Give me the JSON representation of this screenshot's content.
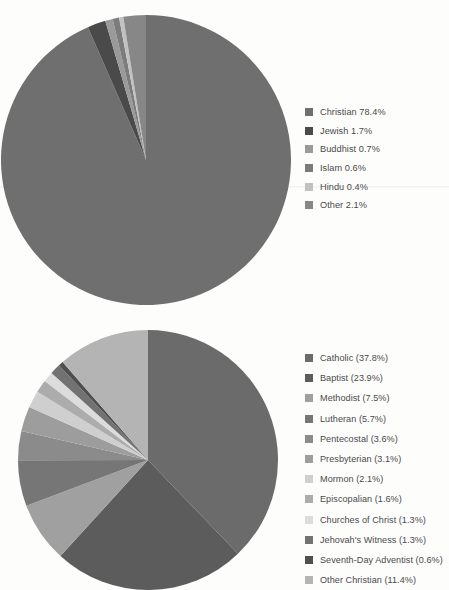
{
  "chart_data": [
    {
      "type": "pie",
      "title": "",
      "legend_position": "right",
      "start_angle": 0,
      "direction": "clockwise",
      "categories": [
        "Christian",
        "Jewish",
        "Buddhist",
        "Islam",
        "Hindu",
        "Other"
      ],
      "values": [
        78.4,
        1.7,
        0.7,
        0.6,
        0.4,
        2.1
      ],
      "unit": "%",
      "colors": [
        "#6f6f6f",
        "#4a4a4a",
        "#9a9a9a",
        "#7c7c7c",
        "#c2c2c2",
        "#878787"
      ],
      "legend_labels": [
        "Christian 78.4%",
        "Jewish 1.7%",
        "Buddhist 0.7%",
        "Islam 0.6%",
        "Hindu 0.4%",
        "Other 2.1%"
      ]
    },
    {
      "type": "pie",
      "title": "",
      "legend_position": "right",
      "start_angle": 0,
      "direction": "clockwise",
      "categories": [
        "Catholic",
        "Baptist",
        "Methodist",
        "Lutheran",
        "Pentecostal",
        "Presbyterian",
        "Mormon",
        "Episcopalian",
        "Churches of Christ",
        "Jehovah's Witness",
        "Seventh-Day Adventist",
        "Other Christian"
      ],
      "values": [
        37.8,
        23.9,
        7.5,
        5.7,
        3.6,
        3.1,
        2.1,
        1.6,
        1.3,
        1.3,
        0.6,
        11.4
      ],
      "unit": "%",
      "colors": [
        "#6b6b6b",
        "#5c5c5c",
        "#a0a0a0",
        "#767676",
        "#8b8b8b",
        "#9d9d9d",
        "#cfcfcf",
        "#acacac",
        "#dcdcdc",
        "#727272",
        "#4f4f4f",
        "#b4b4b4"
      ],
      "legend_labels": [
        "Catholic (37.8%)",
        "Baptist (23.9%)",
        "Methodist (7.5%)",
        "Lutheran (5.7%)",
        "Pentecostal (3.6%)",
        "Presbyterian (3.1%)",
        "Mormon (2.1%)",
        "Episcopalian (1.6%)",
        "Churches of Christ (1.3%)",
        "Jehovah's Witness (1.3%)",
        "Seventh-Day Adventist (0.6%)",
        "Other Christian (11.4%)"
      ]
    }
  ]
}
